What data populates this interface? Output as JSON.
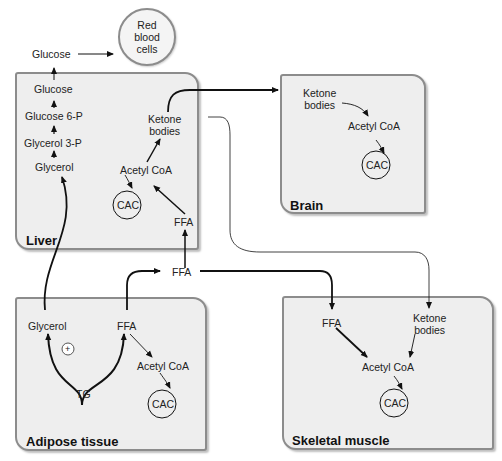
{
  "compartments": {
    "liver": {
      "title": "Liver",
      "labels": {
        "glucose": "Glucose",
        "glucose6p": "Glucose 6-P",
        "glycerol3p": "Glycerol 3-P",
        "glycerol": "Glycerol",
        "ketone1": "Ketone",
        "ketone2": "bodies",
        "acetylcoa": "Acetyl CoA",
        "cac": "CAC",
        "ffa": "FFA"
      }
    },
    "brain": {
      "title": "Brain",
      "labels": {
        "ketone1": "Ketone",
        "ketone2": "bodies",
        "acetylcoa": "Acetyl CoA",
        "cac": "CAC"
      }
    },
    "adipose": {
      "title": "Adipose tissue",
      "labels": {
        "glycerol": "Glycerol",
        "ffa": "FFA",
        "plus": "+",
        "tg": "TG",
        "acetylcoa": "Acetyl CoA",
        "cac": "CAC"
      }
    },
    "muscle": {
      "title": "Skeletal muscle",
      "labels": {
        "ffa": "FFA",
        "ketone1": "Ketone",
        "ketone2": "bodies",
        "acetylcoa": "Acetyl CoA",
        "cac": "CAC"
      }
    }
  },
  "blood": {
    "glucose": "Glucose",
    "ffa": "FFA",
    "rbc": "Red blood cells"
  }
}
